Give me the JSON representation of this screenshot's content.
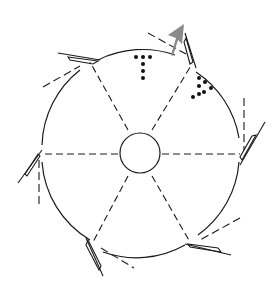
{
  "diagram": {
    "type": "rotor-schematic",
    "description": "Circular wheel with central hub, six dashed radial spokes, six hinged blade flaps on the rim each with a dashed tangent line, dot patterns near top, and a gray arrow indicating direction at top-right",
    "colors": {
      "stroke": "#1a1a1a",
      "arrow": "#8a8a8a",
      "background": "#ffffff"
    },
    "wheel": {
      "cx": 140,
      "cy": 154,
      "r": 99
    },
    "hub": {
      "cx": 140,
      "cy": 153,
      "r": 20
    },
    "spokes": 6,
    "blades": 6,
    "dot_groups": [
      {
        "name": "t-shape",
        "count": 6
      },
      {
        "name": "triangle-cluster",
        "count": 6
      }
    ],
    "arrow": {
      "label": "",
      "direction": "up-right"
    }
  }
}
